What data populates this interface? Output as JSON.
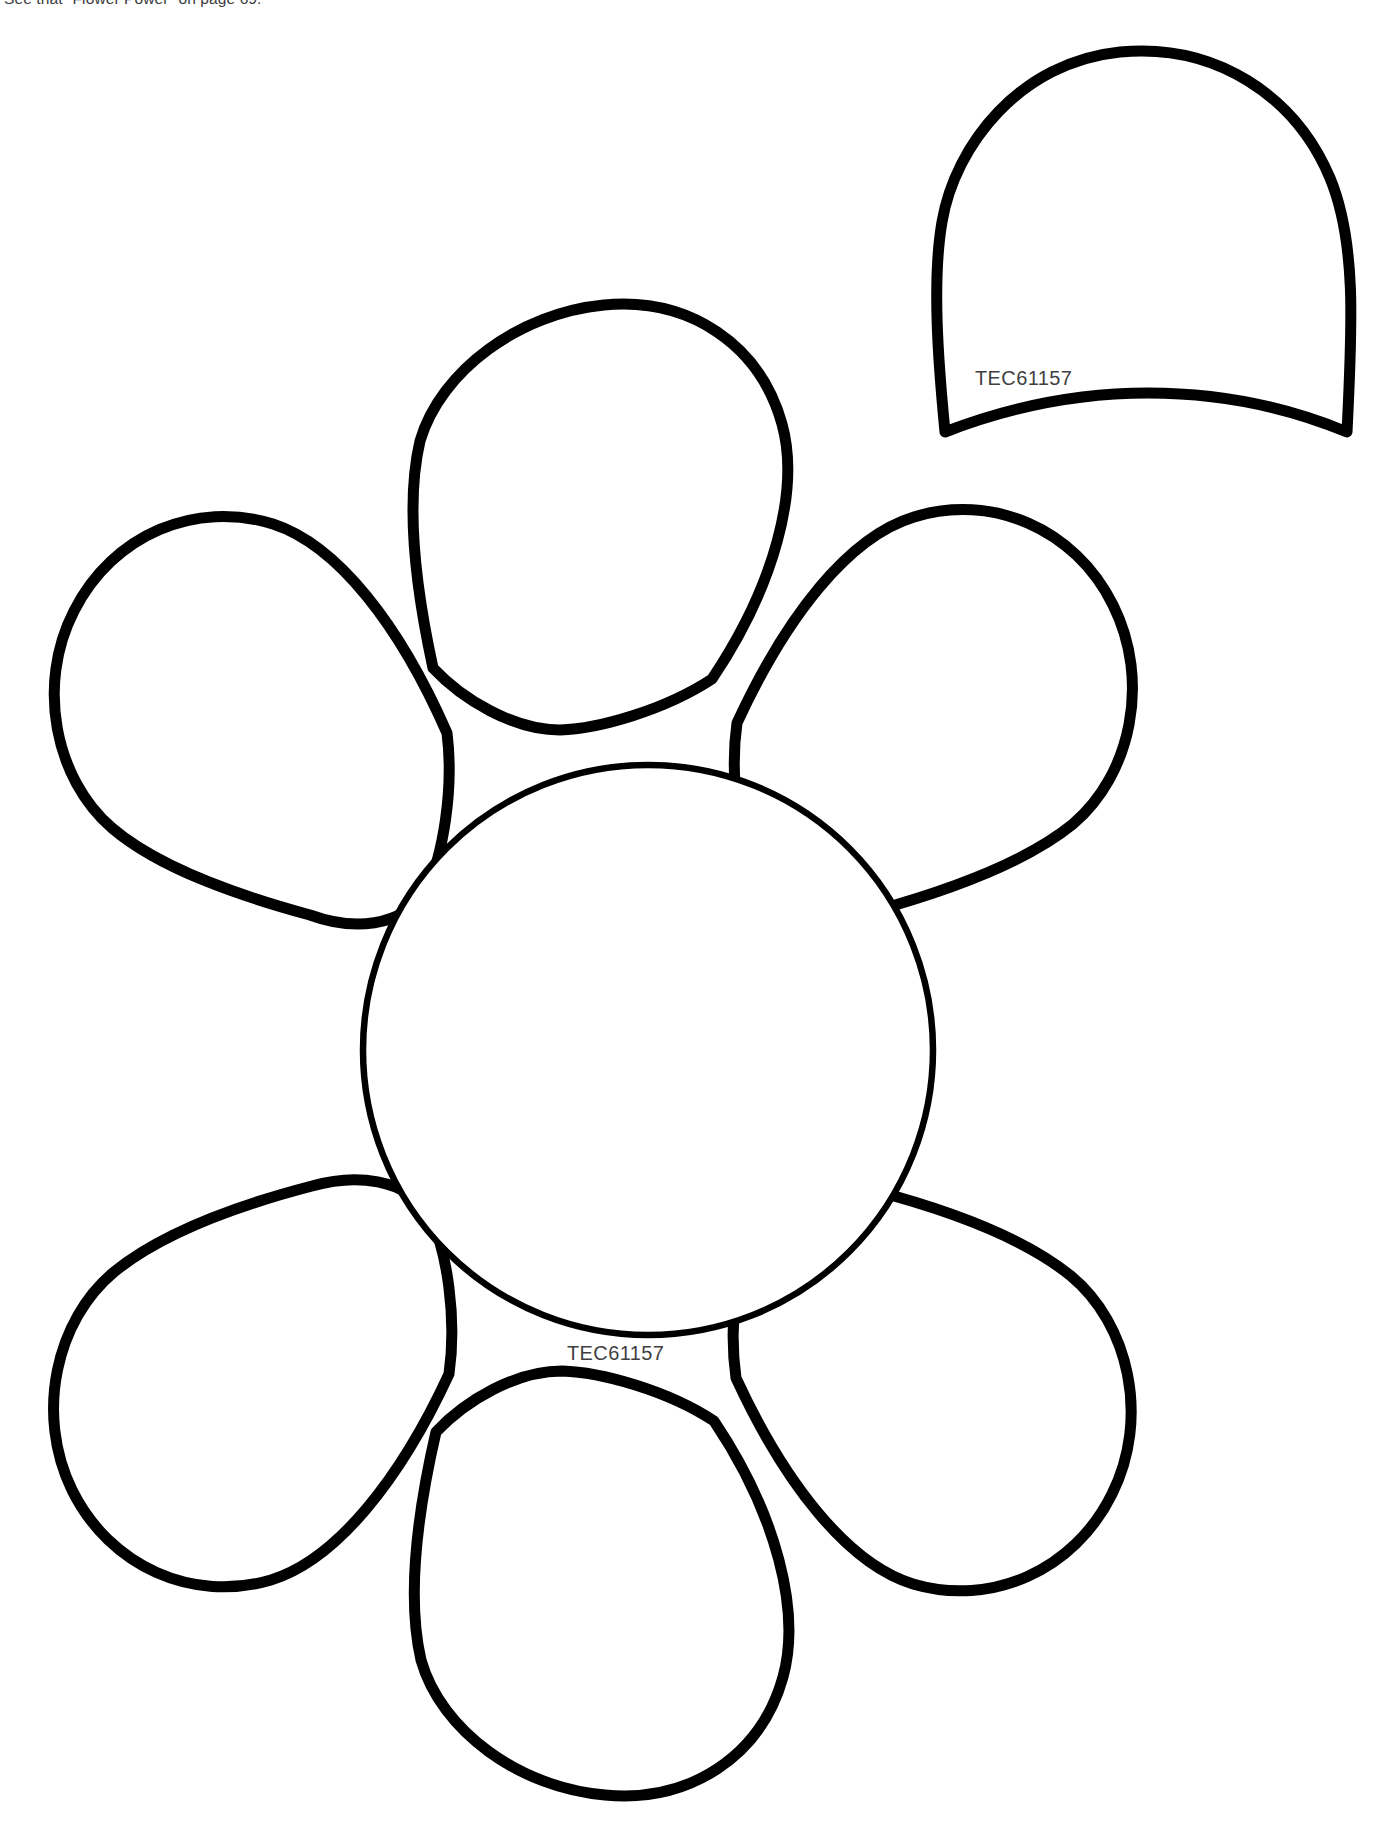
{
  "page": {
    "background_color": "#ffffff",
    "ink_color": "#000000",
    "width": 1377,
    "height": 1832
  },
  "header": {
    "caption": "See that \"Flower Power\" on page 69."
  },
  "pattern": {
    "title": "Flower pattern template",
    "parts": [
      {
        "id": "single-petal",
        "name": "Single petal cut-out piece",
        "label": "TEC61157",
        "label_x": 975,
        "label_y": 385
      },
      {
        "id": "flower-assembly",
        "name": "Six petal flower with center circle",
        "label": "TEC61157",
        "label_x": 567,
        "label_y": 1360,
        "petal_count": 6
      }
    ]
  },
  "labels": {
    "single_petal_code": "TEC61157",
    "flower_center_code": "TEC61157"
  },
  "geometry": {
    "center_circle": {
      "cx": 648,
      "cy": 1050,
      "r": 285
    },
    "petal_angles_deg": [
      90,
      150,
      210,
      270,
      330,
      30
    ],
    "flower_bounds": {
      "left": 38,
      "top": 344,
      "right": 1252,
      "bottom": 1792
    },
    "single_petal_bounds": {
      "left": 938,
      "top": 44,
      "right": 1350,
      "bottom": 436
    }
  }
}
